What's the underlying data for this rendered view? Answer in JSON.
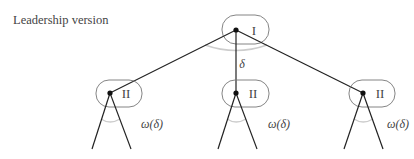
{
  "title": "Leadership version",
  "colors": {
    "edge": "#222222",
    "node_dot": "#111111",
    "info_set_outline": "#777777",
    "angle_arc": "#cccccc",
    "text": "#444444"
  },
  "root": {
    "player": "I",
    "x": 236,
    "y": 30,
    "arc_label": "δ",
    "children": [
      {
        "player": "II",
        "x": 110,
        "y": 93,
        "arc_label": "ω(δ)",
        "leaves": [
          {
            "x": 92,
            "y": 149
          },
          {
            "x": 131,
            "y": 149
          }
        ]
      },
      {
        "player": "II",
        "x": 236,
        "y": 93,
        "arc_label": "ω(δ)",
        "leaves": [
          {
            "x": 218,
            "y": 149
          },
          {
            "x": 257,
            "y": 149
          }
        ]
      },
      {
        "player": "II",
        "x": 363,
        "y": 93,
        "arc_label": "ω(δ)",
        "leaves": [
          {
            "x": 344,
            "y": 149
          },
          {
            "x": 383,
            "y": 149
          }
        ]
      }
    ]
  }
}
